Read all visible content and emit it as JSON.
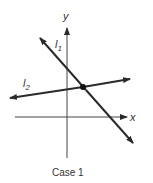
{
  "figure": {
    "caption": "Case 1",
    "axes": {
      "x_label": "x",
      "y_label": "y"
    },
    "lines": [
      {
        "name": "l",
        "subscript": "1",
        "slope": "negative"
      },
      {
        "name": "l",
        "subscript": "2",
        "slope": "positive"
      }
    ],
    "intersection": "single point",
    "colors": {
      "line": "#2a2a2a",
      "axis": "#444444"
    }
  }
}
